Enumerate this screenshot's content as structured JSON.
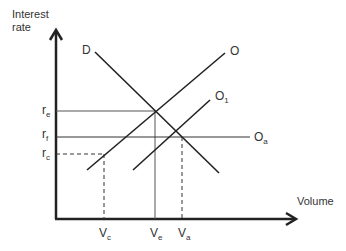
{
  "diagram": {
    "y_axis_label_line1": "Interest",
    "y_axis_label_line2": "rate",
    "x_axis_label": "Volume",
    "curves": {
      "demand": "D",
      "supply": "O",
      "supply_shifted": "O",
      "supply_shifted_sub": "1",
      "supply_flat": "O",
      "supply_flat_sub": "a"
    },
    "rates": [
      {
        "base": "r",
        "sub": "e"
      },
      {
        "base": "r",
        "sub": "f"
      },
      {
        "base": "r",
        "sub": "c"
      }
    ],
    "volumes": [
      {
        "base": "V",
        "sub": "c"
      },
      {
        "base": "V",
        "sub": "e"
      },
      {
        "base": "V",
        "sub": "a"
      }
    ]
  }
}
